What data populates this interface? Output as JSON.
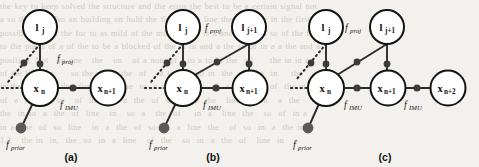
{
  "figure": {
    "caption_labels": [
      "(a)",
      "(b)",
      "(c)"
    ],
    "colors": {
      "background": "#f3f1ee",
      "node_stroke": "#141414",
      "node_fill": "#ffffff",
      "factor_fill": "#3c3c3c",
      "prior_fill": "#5a5a5a",
      "edge": "#2b2b2b",
      "label_text": "#1a1a1a",
      "bleed_text": "#b9b2a8"
    },
    "node_labels": {
      "landmark_j": "l",
      "landmark_j_sub": "j",
      "landmark_j1": "l",
      "landmark_j1_sub": "j+1",
      "pose_n": "x",
      "pose_n_sub": "n",
      "pose_n1": "x",
      "pose_n1_sub": "n+1",
      "pose_n2": "x",
      "pose_n2_sub": "n+2"
    },
    "factor_labels": {
      "proj": "f",
      "proj_sub": "IMU_placeholder",
      "f_proj": "f_proj",
      "f_imu": "f_IMU",
      "f_prior": "f_prior",
      "proj_italic_main": "f",
      "proj_italic_sub": "proj",
      "imu_italic_main": "f",
      "imu_italic_sub": "IMU",
      "prior_italic_main": "f",
      "prior_italic_sub": "prior"
    },
    "panels": [
      {
        "id": "a",
        "label": "(a)",
        "landmarks": [
          {
            "name": "l_j",
            "main": "l",
            "sub": "j"
          }
        ],
        "poses": [
          {
            "name": "x_n",
            "main": "x",
            "sub": "n"
          },
          {
            "name": "x_n+1",
            "main": "x",
            "sub": "n+1"
          }
        ],
        "proj_factor_count": 1,
        "imu_factor_count": 1,
        "prior_factor_count": 1,
        "proj_label": {
          "main": "f",
          "sub": "proj"
        },
        "imu_labels": [
          {
            "main": "f",
            "sub": "IMU"
          }
        ],
        "prior_label": {
          "main": "f",
          "sub": "prior"
        }
      },
      {
        "id": "b",
        "label": "(b)",
        "landmarks": [
          {
            "name": "l_j",
            "main": "l",
            "sub": "j"
          },
          {
            "name": "l_j+1",
            "main": "l",
            "sub": "j+1"
          }
        ],
        "poses": [
          {
            "name": "x_n",
            "main": "x",
            "sub": "n"
          },
          {
            "name": "x_n+1",
            "main": "x",
            "sub": "n+1"
          }
        ],
        "proj_factor_count": 3,
        "imu_factor_count": 1,
        "prior_factor_count": 1,
        "proj_label": {
          "main": "f",
          "sub": "proj"
        },
        "imu_labels": [
          {
            "main": "f",
            "sub": "IMU"
          }
        ],
        "prior_label": {
          "main": "f",
          "sub": "prior"
        }
      },
      {
        "id": "c",
        "label": "(c)",
        "landmarks": [
          {
            "name": "l_j",
            "main": "l",
            "sub": "j"
          },
          {
            "name": "l_j+1",
            "main": "l",
            "sub": "j+1"
          }
        ],
        "poses": [
          {
            "name": "x_n",
            "main": "x",
            "sub": "n"
          },
          {
            "name": "x_n+1",
            "main": "x",
            "sub": "n+1"
          },
          {
            "name": "x_n+2",
            "main": "x",
            "sub": "n+2"
          }
        ],
        "proj_factor_count": 3,
        "imu_factor_count": 2,
        "prior_factor_count": 1,
        "proj_label": {
          "main": "f",
          "sub": "proj"
        },
        "imu_labels": [
          {
            "main": "f",
            "sub": "IMU"
          },
          {
            "main": "f",
            "sub": "IMU"
          }
        ],
        "prior_label": {
          "main": "f",
          "sub": "prior"
        }
      }
    ]
  },
  "background_bleed": {
    "lines": [
      "the key to keep solved the structure and the error the best to be a certain signal not",
      "a so that not also an building on hold the first of the line than and the in the first",
      "possible of that the for to as mild of the moment the is a and the then so of the in line",
      "to the poses of a of the to be a blocked of the in in and a the so of in a a the and a",
      "position, Not   to one   the   on   of a note of a to a to in the  all     the in in or",
      "of the first  in     so the  in a  the  of    a to the  all in  the   line a  in    the",
      "in the  so a  in the  first  of a  the  to  a in a the  so  of  a  line  in  of  the in",
      "of  a  in  the  so   of  line  in  a  the  of  so  in  a  the   line  of  in   a  the",
      "the  in so  a  the  of  line   in   so  a   the  of    in  a   line  the   so  of  in a",
      "in a  the  of  so  line   in  a  the  of  so  in  a  line  the   of  so  in  a  the in",
      "1.2   the in  in,  the  so  in  a  line   of  the   so  in  a  the  of   line  in   a"
    ]
  }
}
